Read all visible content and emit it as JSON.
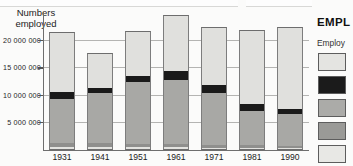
{
  "chart_data": {
    "type": "bar",
    "title": "",
    "xlabel": "",
    "ylabel": "Numbers employed",
    "ylim": [
      0,
      25000000
    ],
    "grid": true,
    "stacked": true,
    "legend_position": "right",
    "ytick_labels": [
      "20 000 000",
      "15 000 000",
      "10 000 000",
      "5 000 000"
    ],
    "ytick_values": [
      20000000,
      15000000,
      10000000,
      5000000
    ],
    "categories": [
      "1931",
      "1941",
      "1951",
      "1961",
      "1971",
      "1981",
      "1990"
    ],
    "series": [
      {
        "name": "segment-1-base",
        "color": "#e3e3e0",
        "values": [
          500000,
          450000,
          400000,
          400000,
          350000,
          350000,
          300000
        ]
      },
      {
        "name": "segment-2",
        "color": "#8f8f8d",
        "values": [
          700000,
          700000,
          600000,
          600000,
          500000,
          450000,
          350000
        ]
      },
      {
        "name": "segment-3",
        "color": "#a8a8a5",
        "values": [
          8100000,
          9200000,
          11300000,
          11700000,
          9400000,
          6200000,
          5900000
        ]
      },
      {
        "name": "segment-4",
        "color": "#1a1a1a",
        "values": [
          1200000,
          900000,
          1100000,
          1700000,
          1600000,
          1300000,
          900000
        ]
      },
      {
        "name": "segment-5-top",
        "color": "#e0e0dd",
        "values": [
          11000000,
          6450000,
          8300000,
          10100000,
          10550000,
          13500000,
          14850000
        ]
      }
    ],
    "totals": [
      21500000,
      17700000,
      21700000,
      24500000,
      22400000,
      21800000,
      22300000
    ]
  },
  "figure": {
    "y_axis_title_line1": "Numbers",
    "y_axis_title_line2": "employed"
  },
  "legend": {
    "title": "EMPL",
    "subtitle": "Employ",
    "swatches": [
      {
        "name": "legend-swatch-1",
        "color": "#e4e4e1"
      },
      {
        "name": "legend-swatch-2",
        "color": "#1b1b1b"
      },
      {
        "name": "legend-swatch-3",
        "color": "#ababa8"
      },
      {
        "name": "legend-swatch-4",
        "color": "#9a9a97"
      },
      {
        "name": "legend-swatch-5",
        "color": "#e8e8e5"
      }
    ]
  }
}
